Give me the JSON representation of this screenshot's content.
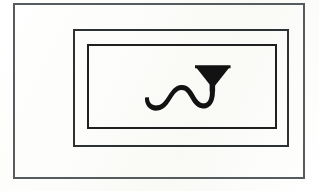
{
  "figure": {
    "background_color": "#fdfdfb",
    "ink_color": "#121212",
    "alt_text": "Three nested rectangular borders enclosing a black serpentine stroke that terminates in a solid triangular funnel head"
  },
  "frames": [
    {
      "name": "outer-frame",
      "label": "Outer border",
      "stroke_color": "#585b5e",
      "stroke_width": 2,
      "x": 13,
      "y": 3,
      "width": 292,
      "height": 176
    },
    {
      "name": "middle-frame",
      "label": "Middle border",
      "stroke_color": "#2e3133",
      "stroke_width": 2,
      "x": 73,
      "y": 29,
      "width": 216,
      "height": 118
    },
    {
      "name": "inner-frame",
      "label": "Inner border",
      "stroke_color": "#1d1f21",
      "stroke_width": 2,
      "x": 87,
      "y": 44,
      "width": 190,
      "height": 85
    }
  ],
  "symbol": {
    "name": "serpentine-funnel-glyph",
    "label": "Serpentine stroke with triangular funnel head",
    "fill_color": "#121212",
    "parts": [
      {
        "name": "wave-tail",
        "label": "Wavy serpentine tail"
      },
      {
        "name": "stem",
        "label": "Vertical stem"
      },
      {
        "name": "funnel-head",
        "label": "Solid inverted triangle head"
      }
    ]
  }
}
